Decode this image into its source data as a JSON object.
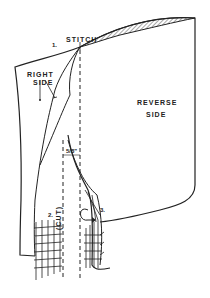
{
  "diagram": {
    "type": "sewing-instruction-illustration",
    "labels": {
      "stitch": "STITCH",
      "right_side_line1": "RIGHT",
      "right_side_line2": "SIDE",
      "reverse_side_line1": "REVERSE",
      "reverse_side_line2": "SIDE",
      "cut": "(CUT)",
      "seam_allowance": "5/8\""
    },
    "steps": {
      "step1": "1.",
      "step2": "2.",
      "step3": "3."
    },
    "colors": {
      "ink": "#222222",
      "background": "#ffffff"
    }
  }
}
